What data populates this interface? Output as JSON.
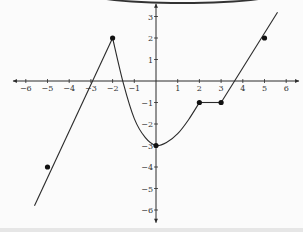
{
  "chart_data": {
    "type": "line",
    "title": "",
    "xlabel": "",
    "ylabel": "",
    "xlim": [
      -6.5,
      6.5
    ],
    "ylim": [
      -6.5,
      3.5
    ],
    "grid": false,
    "x_ticks": [
      -6,
      -5,
      -4,
      -3,
      -2,
      -1,
      1,
      2,
      3,
      4,
      5,
      6
    ],
    "y_ticks": [
      -6,
      -5,
      -4,
      -3,
      -2,
      -1,
      1,
      2,
      3
    ],
    "x_tick_labels": [
      "−6",
      "−5",
      "−4",
      "−3",
      "−2",
      "−1",
      "1",
      "2",
      "3",
      "4",
      "5",
      "6"
    ],
    "y_tick_labels": [
      "−6",
      "−5",
      "−4",
      "−3",
      "−2",
      "−1",
      "1",
      "2",
      "3"
    ],
    "series": [
      {
        "name": "segment-left",
        "kind": "line",
        "points": [
          [
            -5.6,
            -5.8
          ],
          [
            -2,
            2
          ]
        ]
      },
      {
        "name": "segment-parabola",
        "kind": "curve",
        "points": [
          [
            -2,
            2
          ],
          [
            -1.5,
            -0.125
          ],
          [
            -1,
            -1.75
          ],
          [
            -0.5,
            -2.625
          ],
          [
            0,
            -3
          ],
          [
            0.5,
            -2.85
          ],
          [
            1,
            -2.45
          ],
          [
            1.5,
            -1.8
          ],
          [
            2,
            -1
          ]
        ]
      },
      {
        "name": "segment-flat",
        "kind": "line",
        "points": [
          [
            2,
            -1
          ],
          [
            3,
            -1
          ]
        ]
      },
      {
        "name": "segment-right",
        "kind": "line",
        "points": [
          [
            3,
            -1
          ],
          [
            5.6,
            3.2
          ]
        ]
      }
    ],
    "marked_points": [
      [
        -5,
        -4
      ],
      [
        -2,
        2
      ],
      [
        0,
        -3
      ],
      [
        2,
        -1
      ],
      [
        3,
        -1
      ],
      [
        5,
        2
      ]
    ]
  }
}
